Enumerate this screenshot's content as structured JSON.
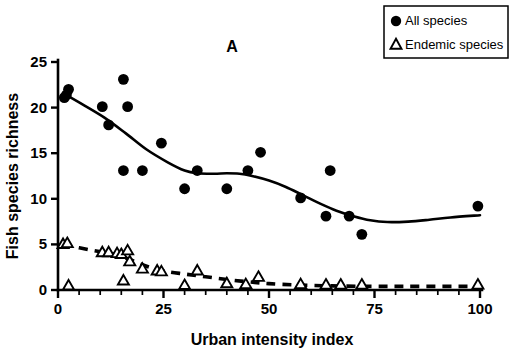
{
  "figure": {
    "panel_label": "A",
    "background_color": "#ffffff",
    "ink_color": "#000000"
  },
  "legend": {
    "position": "top-right",
    "entries": [
      {
        "label": "All species",
        "marker": "filled-circle",
        "color": "#000000"
      },
      {
        "label": "Endemic species",
        "marker": "open-triangle",
        "color": "#000000"
      }
    ]
  },
  "chart_data": {
    "type": "scatter",
    "title": "A",
    "xlabel": "Urban intensity index",
    "ylabel": "Fish species richness",
    "xlim": [
      0,
      100
    ],
    "ylim": [
      0,
      25
    ],
    "xticks": [
      0,
      25,
      50,
      75,
      100
    ],
    "yticks": [
      0,
      5,
      10,
      15,
      20,
      25
    ],
    "x_minor_tick_step": 5,
    "grid": false,
    "legend_position": "upper right",
    "series": [
      {
        "name": "All species",
        "marker": "filled-circle",
        "color": "#000000",
        "points": [
          [
            1.5,
            21.1
          ],
          [
            2.5,
            22.0
          ],
          [
            2.0,
            21.4
          ],
          [
            10.5,
            20.1
          ],
          [
            12.0,
            18.1
          ],
          [
            15.5,
            23.1
          ],
          [
            15.5,
            13.1
          ],
          [
            16.5,
            20.1
          ],
          [
            20.0,
            13.1
          ],
          [
            24.5,
            16.1
          ],
          [
            30.0,
            11.1
          ],
          [
            33.0,
            13.1
          ],
          [
            40.0,
            11.1
          ],
          [
            45.0,
            13.1
          ],
          [
            48.0,
            15.1
          ],
          [
            57.5,
            10.1
          ],
          [
            63.5,
            8.1
          ],
          [
            64.5,
            13.1
          ],
          [
            69.0,
            8.1
          ],
          [
            72.0,
            6.1
          ],
          [
            99.5,
            9.2
          ]
        ],
        "trend": {
          "style": "solid",
          "points": [
            [
              1.5,
              21.5
            ],
            [
              6,
              20.3
            ],
            [
              11,
              18.9
            ],
            [
              16,
              17.2
            ],
            [
              21,
              15.4
            ],
            [
              26,
              14.0
            ],
            [
              30,
              13.1
            ],
            [
              33,
              12.8
            ],
            [
              37,
              12.75
            ],
            [
              40,
              12.8
            ],
            [
              43,
              12.75
            ],
            [
              46,
              12.5
            ],
            [
              50,
              12.0
            ],
            [
              54,
              11.3
            ],
            [
              58,
              10.4
            ],
            [
              62,
              9.5
            ],
            [
              66,
              8.7
            ],
            [
              70,
              8.1
            ],
            [
              74,
              7.65
            ],
            [
              78,
              7.45
            ],
            [
              83,
              7.5
            ],
            [
              88,
              7.7
            ],
            [
              93,
              7.95
            ],
            [
              100,
              8.2
            ]
          ]
        }
      },
      {
        "name": "Endemic species",
        "marker": "open-triangle",
        "color": "#000000",
        "points": [
          [
            1.2,
            5.0
          ],
          [
            2.2,
            5.1
          ],
          [
            2.5,
            0.45
          ],
          [
            10.5,
            4.1
          ],
          [
            12.0,
            4.1
          ],
          [
            14.0,
            4.0
          ],
          [
            15.0,
            3.9
          ],
          [
            15.5,
            1.0
          ],
          [
            16.5,
            4.3
          ],
          [
            17.0,
            3.1
          ],
          [
            20.0,
            2.3
          ],
          [
            23.5,
            2.1
          ],
          [
            24.5,
            2.0
          ],
          [
            30.0,
            0.5
          ],
          [
            33.0,
            2.1
          ],
          [
            40.0,
            0.7
          ],
          [
            44.5,
            0.6
          ],
          [
            47.5,
            1.4
          ],
          [
            57.5,
            0.6
          ],
          [
            63.5,
            0.55
          ],
          [
            67.0,
            0.55
          ],
          [
            72.0,
            0.55
          ],
          [
            99.5,
            0.55
          ]
        ],
        "trend": {
          "style": "dashed",
          "points": [
            [
              1.2,
              5.0
            ],
            [
              8,
              4.35
            ],
            [
              13,
              3.95
            ],
            [
              17,
              3.35
            ],
            [
              21,
              2.6
            ],
            [
              25,
              2.1
            ],
            [
              30,
              1.75
            ],
            [
              35,
              1.45
            ],
            [
              40,
              1.15
            ],
            [
              45,
              0.9
            ],
            [
              50,
              0.7
            ],
            [
              57,
              0.55
            ],
            [
              65,
              0.45
            ],
            [
              75,
              0.4
            ],
            [
              85,
              0.4
            ],
            [
              100,
              0.4
            ]
          ]
        }
      }
    ]
  }
}
